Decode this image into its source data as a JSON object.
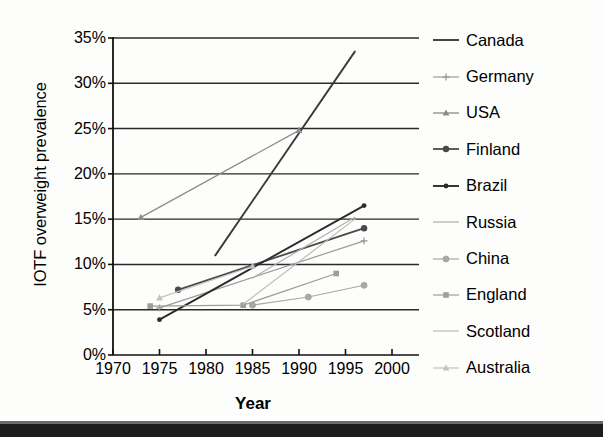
{
  "chart_data": {
    "type": "line",
    "title": "",
    "xlabel": "Year",
    "ylabel": "IOTF overweight prevalence",
    "xlim": [
      1970,
      2000
    ],
    "ylim": [
      0,
      35
    ],
    "xticks": [
      "1970",
      "1975",
      "1980",
      "1985",
      "1990",
      "1995",
      "2000"
    ],
    "yticks": [
      "0%",
      "5%",
      "10%",
      "15%",
      "20%",
      "25%",
      "30%",
      "35%"
    ],
    "grid": "horizontal",
    "legend_position": "right",
    "series": [
      {
        "name": "Canada",
        "color": "#3a3a3a",
        "marker": "none",
        "width": 1.9,
        "x": [
          1981,
          1996
        ],
        "values": [
          11.0,
          33.5
        ]
      },
      {
        "name": "Germany",
        "color": "#9a9a9a",
        "marker": "plus",
        "width": 1.2,
        "x": [
          1975,
          1997
        ],
        "values": [
          5.2,
          12.6
        ]
      },
      {
        "name": "USA",
        "color": "#8c8c8c",
        "marker": "triangle",
        "width": 1.3,
        "x": [
          1973,
          1990
        ],
        "values": [
          15.2,
          24.8
        ]
      },
      {
        "name": "Finland",
        "color": "#4a4a4a",
        "marker": "circle",
        "width": 1.8,
        "x": [
          1977,
          1997
        ],
        "values": [
          7.2,
          14.0
        ]
      },
      {
        "name": "Brazil",
        "color": "#2b2b2b",
        "marker": "dot",
        "width": 1.9,
        "x": [
          1975,
          1997
        ],
        "values": [
          3.9,
          16.5
        ]
      },
      {
        "name": "Russia",
        "color": "#b0b0b0",
        "marker": "none",
        "width": 1.2,
        "x": [
          1985,
          1996
        ],
        "values": [
          8.5,
          15.2
        ]
      },
      {
        "name": "China",
        "color": "#a8a8a8",
        "marker": "circle-open",
        "width": 1.2,
        "x": [
          1985,
          1991,
          1997
        ],
        "values": [
          5.5,
          6.4,
          7.7
        ]
      },
      {
        "name": "England",
        "color": "#9d9d9d",
        "marker": "square",
        "width": 1.2,
        "x": [
          1974,
          1984,
          1994
        ],
        "values": [
          5.4,
          5.5,
          9.0
        ]
      },
      {
        "name": "Scotland",
        "color": "#bcbcbc",
        "marker": "none",
        "width": 1.2,
        "x": [
          1984,
          1996
        ],
        "values": [
          5.6,
          15.0
        ]
      },
      {
        "name": "Australia",
        "color": "#c2c2c2",
        "marker": "tri-open",
        "width": 1.2,
        "x": [
          1975,
          1985
        ],
        "values": [
          6.3,
          9.8
        ]
      }
    ]
  },
  "axes": {
    "y_title": "IOTF overweight prevalence",
    "x_title": "Year",
    "y_labels": [
      "35%",
      "30%",
      "25%",
      "20%",
      "15%",
      "10%",
      "5%",
      "0%"
    ],
    "x_labels": [
      "1970",
      "1975",
      "1980",
      "1985",
      "1990",
      "1995",
      "2000"
    ]
  },
  "legend": {
    "items": [
      {
        "label": "Canada"
      },
      {
        "label": "Germany"
      },
      {
        "label": "USA"
      },
      {
        "label": "Finland"
      },
      {
        "label": "Brazil"
      },
      {
        "label": "Russia"
      },
      {
        "label": "China"
      },
      {
        "label": "England"
      },
      {
        "label": "Scotland"
      },
      {
        "label": "Australia"
      }
    ]
  }
}
